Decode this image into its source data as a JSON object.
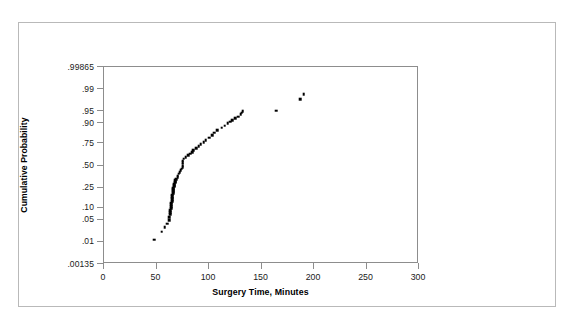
{
  "chart_data": {
    "type": "scatter",
    "title": "",
    "xlabel": "Surgery Time, Minutes",
    "ylabel": "Cumulative Probability",
    "yscale": "normal-probability",
    "xlim": [
      0,
      300
    ],
    "xticks": [
      0,
      50,
      100,
      150,
      200,
      250,
      300
    ],
    "xticklabels": [
      "0",
      "50",
      "100",
      "150",
      "200",
      "250",
      "300"
    ],
    "yticks": [
      0.00135,
      0.01,
      0.05,
      0.1,
      0.25,
      0.5,
      0.75,
      0.9,
      0.95,
      0.99,
      0.99865
    ],
    "yticklabels": [
      ".00135",
      ".01",
      ".05",
      ".10",
      ".25",
      ".50",
      ".75",
      ".90",
      ".95",
      ".99",
      ".99865"
    ],
    "ylim": [
      0.00135,
      0.99865
    ],
    "grid": false,
    "legend": null,
    "marker": "square",
    "marker_color": "#000000",
    "series": [
      {
        "name": "Surgery Time",
        "x": [
          48,
          55,
          58,
          60,
          62,
          62,
          63,
          63,
          63,
          64,
          64,
          64,
          64,
          65,
          65,
          65,
          65,
          65,
          66,
          66,
          66,
          66,
          66,
          67,
          67,
          67,
          67,
          68,
          68,
          68,
          69,
          70,
          70,
          71,
          72,
          73,
          74,
          75,
          75,
          75,
          75,
          75,
          76,
          78,
          80,
          82,
          84,
          85,
          88,
          90,
          92,
          95,
          97,
          100,
          103,
          105,
          108,
          112,
          115,
          118,
          120,
          122,
          125,
          128,
          130,
          131,
          132,
          164,
          187,
          190
        ],
        "p": [
          0.012,
          0.022,
          0.03,
          0.038,
          0.048,
          0.058,
          0.068,
          0.078,
          0.088,
          0.098,
          0.108,
          0.118,
          0.128,
          0.14,
          0.152,
          0.164,
          0.176,
          0.188,
          0.2,
          0.212,
          0.224,
          0.236,
          0.248,
          0.258,
          0.268,
          0.278,
          0.288,
          0.3,
          0.312,
          0.324,
          0.34,
          0.36,
          0.38,
          0.4,
          0.42,
          0.44,
          0.46,
          0.48,
          0.5,
          0.52,
          0.54,
          0.56,
          0.58,
          0.6,
          0.62,
          0.64,
          0.66,
          0.68,
          0.7,
          0.72,
          0.74,
          0.76,
          0.78,
          0.8,
          0.82,
          0.84,
          0.86,
          0.875,
          0.888,
          0.9,
          0.908,
          0.916,
          0.924,
          0.932,
          0.94,
          0.946,
          0.95,
          0.952,
          0.978,
          0.985
        ]
      }
    ]
  }
}
